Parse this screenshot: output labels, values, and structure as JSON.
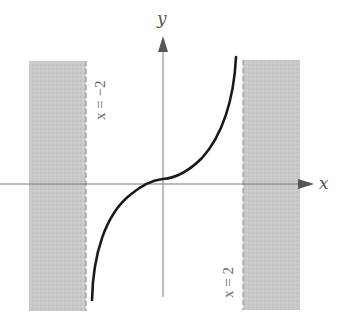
{
  "figure": {
    "axes": {
      "x_label": "x",
      "y_label": "y"
    },
    "asymptotes": [
      {
        "label": "x = −2",
        "value": -2
      },
      {
        "label": "x = 2",
        "value": 2
      }
    ],
    "curve": {
      "description": "odd increasing function with vertical asymptotes at x = -2 and x = 2",
      "color": "#1a1a1a"
    },
    "colors": {
      "shade": "#c6c6c6",
      "axis": "#777777",
      "dash": "#888888"
    }
  }
}
